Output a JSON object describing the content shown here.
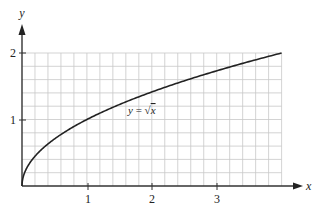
{
  "chart_data": {
    "type": "line",
    "title": "",
    "xlabel": "x",
    "ylabel": "y",
    "xlim": [
      0,
      4
    ],
    "ylim": [
      0,
      2
    ],
    "grid": true,
    "grid_step": {
      "x": 0.2,
      "y": 0.2
    },
    "x_ticks": [
      "1",
      "2",
      "3"
    ],
    "y_ticks": [
      "1",
      "2"
    ],
    "series": [
      {
        "name": "y = √x",
        "function": "sqrt(x)",
        "x": [
          0,
          0.04,
          0.25,
          0.5,
          1,
          1.5,
          2,
          2.5,
          3,
          3.5,
          4
        ],
        "values": [
          0,
          0.2,
          0.5,
          0.707,
          1,
          1.225,
          1.414,
          1.581,
          1.732,
          1.871,
          2
        ]
      }
    ],
    "annotations": [
      {
        "text": "y = √x",
        "x": 1.9,
        "y": 1.25
      }
    ]
  },
  "labels": {
    "x_axis": "x",
    "y_axis": "y",
    "x_tick_1": "1",
    "x_tick_2": "2",
    "x_tick_3": "3",
    "y_tick_1": "1",
    "y_tick_2": "2",
    "curve_y": "y",
    "curve_eq": " = ",
    "curve_sqrt": "√",
    "curve_x": "x"
  },
  "colors": {
    "grid": "#c8c8c8",
    "axis": "#333333",
    "curve": "#222222"
  }
}
